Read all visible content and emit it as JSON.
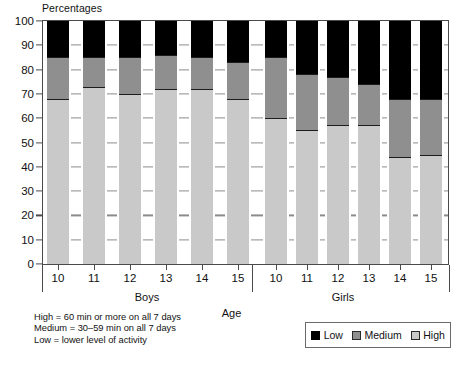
{
  "chart_data": {
    "type": "bar",
    "subtype": "stacked-100-percent",
    "title": "",
    "ylabel": "Percentages",
    "xlabel": "Age",
    "ylim": [
      0,
      100
    ],
    "ytick_step": 10,
    "yticks": [
      "100",
      "90",
      "80",
      "70",
      "60",
      "50",
      "40",
      "30",
      "20",
      "10",
      "0"
    ],
    "grid": "dashed-horizontal",
    "legend_position": "bottom-right",
    "categories": [
      "10",
      "11",
      "12",
      "13",
      "14",
      "15",
      "10",
      "11",
      "12",
      "13",
      "14",
      "15"
    ],
    "groups": [
      {
        "label": "Boys",
        "categories": [
          "10",
          "11",
          "12",
          "13",
          "14",
          "15"
        ]
      },
      {
        "label": "Girls",
        "categories": [
          "10",
          "11",
          "12",
          "13",
          "14",
          "15"
        ]
      }
    ],
    "series": [
      {
        "name": "High",
        "color": "#c9c9c9",
        "values": [
          68,
          73,
          70,
          72,
          72,
          68,
          60,
          55,
          57,
          57,
          44,
          45
        ]
      },
      {
        "name": "Medium",
        "color": "#8f8f8f",
        "values": [
          17,
          12,
          15,
          14,
          13,
          15,
          25,
          23,
          20,
          17,
          24,
          23
        ]
      },
      {
        "name": "Low",
        "color": "#000000",
        "values": [
          15,
          15,
          15,
          14,
          15,
          17,
          15,
          22,
          23,
          26,
          32,
          32
        ]
      }
    ],
    "stack_order_bottom_to_top": [
      "High",
      "Medium",
      "Low"
    ],
    "bars": [
      {
        "group": "Boys",
        "age": "10",
        "high": 68,
        "medium": 17,
        "low": 15
      },
      {
        "group": "Boys",
        "age": "11",
        "high": 73,
        "medium": 12,
        "low": 15
      },
      {
        "group": "Boys",
        "age": "12",
        "high": 70,
        "medium": 15,
        "low": 15
      },
      {
        "group": "Boys",
        "age": "13",
        "high": 72,
        "medium": 14,
        "low": 14
      },
      {
        "group": "Boys",
        "age": "14",
        "high": 72,
        "medium": 13,
        "low": 15
      },
      {
        "group": "Boys",
        "age": "15",
        "high": 68,
        "medium": 15,
        "low": 17
      },
      {
        "group": "Girls",
        "age": "10",
        "high": 60,
        "medium": 25,
        "low": 15
      },
      {
        "group": "Girls",
        "age": "11",
        "high": 55,
        "medium": 23,
        "low": 22
      },
      {
        "group": "Girls",
        "age": "12",
        "high": 57,
        "medium": 20,
        "low": 23
      },
      {
        "group": "Girls",
        "age": "13",
        "high": 57,
        "medium": 17,
        "low": 26
      },
      {
        "group": "Girls",
        "age": "14",
        "high": 44,
        "medium": 24,
        "low": 32
      },
      {
        "group": "Girls",
        "age": "15",
        "high": 45,
        "medium": 23,
        "low": 32
      }
    ],
    "annotations": [
      "High = 60 min or more on all 7 days",
      "Medium = 30–59 min on all 7 days",
      "Low = lower level of activity"
    ]
  },
  "legend": {
    "items": [
      {
        "label": "Low",
        "color": "#000000"
      },
      {
        "label": "Medium",
        "color": "#8f8f8f"
      },
      {
        "label": "High",
        "color": "#c9c9c9"
      }
    ]
  },
  "footnote": {
    "line1": "High = 60 min or more on all 7 days",
    "line2": "Medium = 30–59 min on all 7 days",
    "line3": "Low = lower level of activity"
  }
}
